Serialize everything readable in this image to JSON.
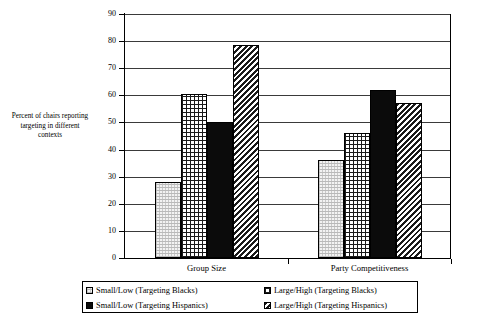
{
  "chart_data": {
    "type": "bar",
    "title": "",
    "xlabel": "",
    "ylabel": "Percent of chairs reporting targeting in different contexts",
    "ylabel_lines": [
      "Percent of chairs reporting",
      "targeting in different",
      "contexts"
    ],
    "categories": [
      "Group Size",
      "Party Competitiveness"
    ],
    "ylim": [
      0,
      90
    ],
    "ytick_step": 10,
    "ytick_labels": [
      "0",
      "10",
      "20",
      "30",
      "40",
      "50",
      "60",
      "70",
      "80",
      "90"
    ],
    "grid": true,
    "legend_position": "bottom",
    "series": [
      {
        "name": "Small/Low (Targeting Blacks)",
        "pattern": "light-dotted",
        "values": [
          28,
          36
        ]
      },
      {
        "name": "Large/High (Targeting Blacks)",
        "pattern": "cross-hatch-grid",
        "values": [
          60.5,
          46
        ]
      },
      {
        "name": "Small/Low (Targeting Hispanics)",
        "pattern": "solid-black",
        "values": [
          50,
          62
        ]
      },
      {
        "name": "Large/High (Targeting Hispanics)",
        "pattern": "diagonal-hatch",
        "values": [
          78.5,
          57
        ]
      }
    ]
  },
  "legend": {
    "items": [
      {
        "label": "Small/Low (Targeting Blacks)",
        "swatch": "light-dotted"
      },
      {
        "label": "Large/High (Targeting Blacks)",
        "swatch": "cross-hatch-grid"
      },
      {
        "label": "Small/Low (Targeting Hispanics)",
        "swatch": "solid-black"
      },
      {
        "label": "Large/High (Targeting Hispanics)",
        "swatch": "diagonal-hatch"
      }
    ]
  },
  "colors": {
    "axis": "#000000",
    "gridline": "#3a3a3a",
    "bar_solid": "#0b0b0b",
    "bar_light": "#f2f2f2",
    "background": "#ffffff"
  }
}
